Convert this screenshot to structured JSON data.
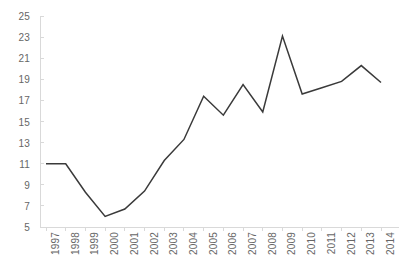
{
  "chart_data": {
    "type": "line",
    "title": "",
    "subtitle": "",
    "xlabel": "",
    "ylabel": "",
    "categories": [
      "1997",
      "1998",
      "1999",
      "2000",
      "2001",
      "2002",
      "2003",
      "2004",
      "2005",
      "2006",
      "2007",
      "2008",
      "2009",
      "2010",
      "2011",
      "2012",
      "2013",
      "2014"
    ],
    "series": [
      {
        "name": "",
        "values": [
          11.0,
          11.0,
          8.3,
          6.0,
          6.7,
          8.4,
          11.3,
          13.3,
          17.4,
          15.6,
          18.5,
          15.9,
          23.1,
          17.6,
          18.2,
          18.8,
          20.3,
          18.7
        ]
      }
    ],
    "ylim": [
      5,
      25
    ],
    "y_ticks": [
      5,
      7,
      9,
      11,
      13,
      15,
      17,
      19,
      21,
      23,
      25
    ],
    "y_tick_labels": [
      "5",
      "7",
      "9",
      "11",
      "13",
      "15",
      "17",
      "19",
      "21",
      "23",
      "25"
    ],
    "x_tick_labels": [
      "1997",
      "1998",
      "1999",
      "2000",
      "2001",
      "2002",
      "2003",
      "2004",
      "2005",
      "2006",
      "2007",
      "2008",
      "2009",
      "2010",
      "2011",
      "2012",
      "2013",
      "2014"
    ],
    "grid": false,
    "legend": false,
    "legend_position": "none",
    "line_color": "#3a3a3a",
    "axis_color": "#d9d9d9",
    "tick_label_color": "#666666",
    "background_color": "#ffffff"
  },
  "layout": {
    "plot_left": 46,
    "plot_right": 381,
    "plot_top": 16,
    "plot_bottom": 227
  }
}
